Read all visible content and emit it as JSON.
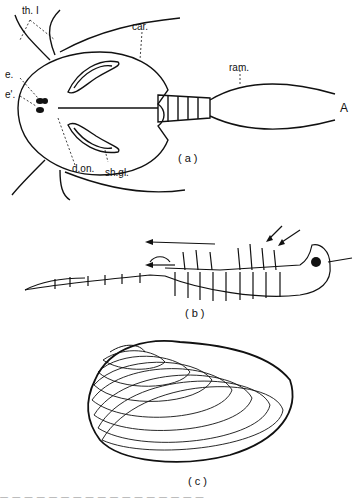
{
  "figure": {
    "panels": [
      {
        "id": "a",
        "caption": "(a)",
        "subject": "notostracan crustacean, dorsal view",
        "labels": {
          "th1": "th. I",
          "e": "e.",
          "e_prime": "e'.",
          "car": "car.",
          "ram": "ram.",
          "don": "d.on.",
          "shgl": "sh.gl.",
          "A": "A"
        }
      },
      {
        "id": "b",
        "caption": "(b)",
        "subject": "anostracan crustacean, lateral view with water-current arrows"
      },
      {
        "id": "c",
        "caption": "(c)",
        "subject": "conchostracan bivalved carapace with growth lines"
      }
    ],
    "footer_text": "— — —   — —   — — —   — —   — — —   — —   — —"
  }
}
